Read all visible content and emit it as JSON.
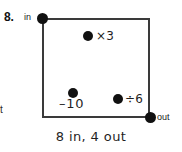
{
  "problem": {
    "number": "8."
  },
  "margin": {
    "fragment": "t"
  },
  "diagram": {
    "endpoints": {
      "in_label": "in",
      "out_label": "out"
    },
    "nodes": [
      {
        "id": "multiply",
        "label": "×3"
      },
      {
        "id": "subtract",
        "label": "–10"
      },
      {
        "id": "divide",
        "label": "÷6"
      }
    ]
  },
  "caption": {
    "text": "8 in, 4 out"
  },
  "colors": {
    "path_stroke": "#3a3a3a",
    "dot_fill": "#111111",
    "background": "#ffffff",
    "text": "#1f1f1f"
  }
}
